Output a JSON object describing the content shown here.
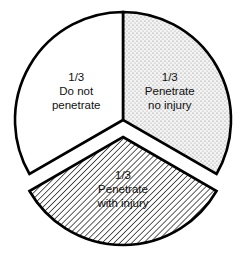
{
  "chart_data": {
    "type": "pie",
    "title": "",
    "slices": [
      {
        "name": "do-not-penetrate",
        "value": 0.3333,
        "fraction_label": "1/3",
        "label_lines": [
          "Do not",
          "penetrate"
        ],
        "fill": "plain",
        "color": "#ffffff",
        "exploded": false
      },
      {
        "name": "penetrate-no-injury",
        "value": 0.3333,
        "fraction_label": "1/3",
        "label_lines": [
          "Penetrate",
          "no injury"
        ],
        "fill": "stipple",
        "color": "#e6e6e6",
        "exploded": false
      },
      {
        "name": "penetrate-with-injury",
        "value": 0.3333,
        "fraction_label": "1/3",
        "label_lines": [
          "Penetrate",
          "with injury"
        ],
        "fill": "diagonal-hatch",
        "color": "#ffffff",
        "exploded": true
      }
    ],
    "legend": "none"
  }
}
